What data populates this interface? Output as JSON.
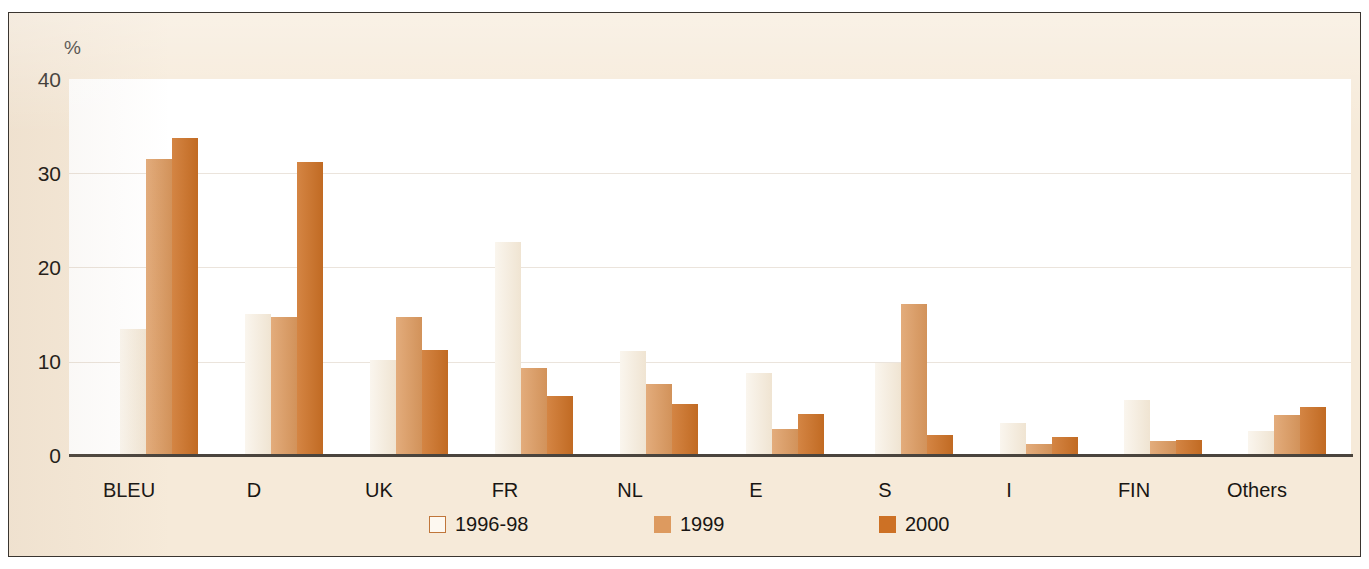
{
  "chart_data": {
    "type": "bar",
    "title": "",
    "subtitle": "",
    "xlabel": "",
    "ylabel": "%",
    "ylim": [
      0,
      40
    ],
    "yticks": [
      0,
      10,
      20,
      30,
      40
    ],
    "ytick_labels": [
      "0",
      "10",
      "20",
      "30",
      "40"
    ],
    "grid": true,
    "legend_position": "bottom",
    "categories": [
      "BLEU",
      "D",
      "UK",
      "FR",
      "NL",
      "E",
      "S",
      "I",
      "FIN",
      "Others"
    ],
    "series": [
      {
        "name": "1996-98",
        "color": "#f4ead9",
        "values": [
          13.5,
          15.1,
          10.2,
          22.7,
          11.1,
          8.8,
          9.9,
          3.5,
          5.9,
          2.7
        ]
      },
      {
        "name": "1999",
        "color": "#dd9a5f",
        "values": [
          31.5,
          14.7,
          14.7,
          9.3,
          7.6,
          2.9,
          16.1,
          1.3,
          1.6,
          4.3
        ]
      },
      {
        "name": "2000",
        "color": "#cd7125",
        "values": [
          33.7,
          31.2,
          11.3,
          6.4,
          5.5,
          4.5,
          2.2,
          2.0,
          1.7,
          5.2
        ]
      }
    ]
  },
  "axis": {
    "unit_label": "%",
    "tick_0": "0",
    "tick_10": "10",
    "tick_20": "20",
    "tick_30": "30",
    "tick_40": "40"
  },
  "categories": {
    "c0": "BLEU",
    "c1": "D",
    "c2": "UK",
    "c3": "FR",
    "c4": "NL",
    "c5": "E",
    "c6": "S",
    "c7": "I",
    "c8": "FIN",
    "c9": "Others"
  },
  "legend": {
    "item0": "1996-98",
    "item1": "1999",
    "item2": "2000"
  },
  "colors": {
    "panel_background": "#f6ead9",
    "plot_background": "#ffffff",
    "frame": "#3a3530",
    "axis": "#4a443d",
    "series_1996_98": "#f4ead9",
    "series_1999": "#dd9a5f",
    "series_2000": "#cd7125",
    "text": "#191613"
  }
}
